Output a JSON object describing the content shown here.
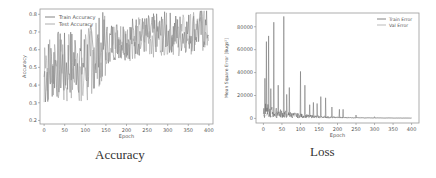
{
  "chart_data": [
    {
      "type": "line",
      "title": "",
      "caption": "Accuracy",
      "xlabel": "Epoch",
      "ylabel": "Accuracy",
      "xlim": [
        -10,
        410
      ],
      "ylim": [
        0.18,
        0.83
      ],
      "xticks": [
        0,
        50,
        100,
        150,
        200,
        250,
        300,
        350,
        400
      ],
      "yticks": [
        0.2,
        0.3,
        0.4,
        0.5,
        0.6,
        0.7,
        0.8
      ],
      "legend": {
        "position": "upper left",
        "entries": [
          "Train Accuracy",
          "Test Accuracy"
        ]
      },
      "grid": false,
      "series": [
        {
          "name": "Train Accuracy",
          "trend": "noisy, rising from ~0.5 to ~0.72",
          "x": [
            0,
            25,
            50,
            75,
            100,
            125,
            150,
            175,
            200,
            225,
            250,
            275,
            300,
            325,
            350,
            375,
            400
          ],
          "values": [
            0.45,
            0.52,
            0.5,
            0.55,
            0.52,
            0.58,
            0.63,
            0.66,
            0.66,
            0.68,
            0.68,
            0.69,
            0.7,
            0.69,
            0.7,
            0.71,
            0.72
          ]
        },
        {
          "name": "Test Accuracy",
          "trend": "noisy, rising from ~0.5 to ~0.7 with oscillation 0.2-0.82",
          "x": [
            0,
            25,
            50,
            75,
            100,
            125,
            150,
            175,
            200,
            225,
            250,
            275,
            300,
            325,
            350,
            375,
            400
          ],
          "values": [
            0.44,
            0.5,
            0.48,
            0.52,
            0.5,
            0.57,
            0.62,
            0.64,
            0.65,
            0.67,
            0.67,
            0.68,
            0.69,
            0.68,
            0.69,
            0.7,
            0.71
          ]
        }
      ]
    },
    {
      "type": "line",
      "title": "",
      "caption": "Loss",
      "xlabel": "Epoch",
      "ylabel": "Mean Square Error [Bugs²]",
      "xlim": [
        -20,
        420
      ],
      "ylim": [
        -4000,
        92000
      ],
      "xticks": [
        0,
        50,
        100,
        150,
        200,
        250,
        300,
        350,
        400
      ],
      "yticks": [
        0,
        20000,
        40000,
        60000,
        80000
      ],
      "legend": {
        "position": "upper right",
        "entries": [
          "Train Error",
          "Val Error"
        ]
      },
      "grid": false,
      "series": [
        {
          "name": "Train Error",
          "spikes": [
            [
              4,
              35000
            ],
            [
              8,
              67000
            ],
            [
              14,
              72000
            ],
            [
              20,
              26000
            ],
            [
              28,
              84000
            ],
            [
              40,
              29000
            ],
            [
              55,
              89000
            ],
            [
              63,
              21000
            ],
            [
              70,
              27000
            ],
            [
              100,
              41000
            ],
            [
              112,
              29000
            ],
            [
              125,
              12000
            ],
            [
              135,
              14000
            ],
            [
              145,
              13000
            ],
            [
              155,
              19000
            ],
            [
              168,
              18000
            ],
            [
              185,
              10000
            ],
            [
              205,
              8000
            ],
            [
              215,
              8000
            ],
            [
              250,
              3000
            ],
            [
              300,
              1500
            ],
            [
              400,
              500
            ]
          ]
        },
        {
          "name": "Val Error",
          "values_note": "low baseline 0-10000 decaying toward 0"
        }
      ]
    }
  ]
}
